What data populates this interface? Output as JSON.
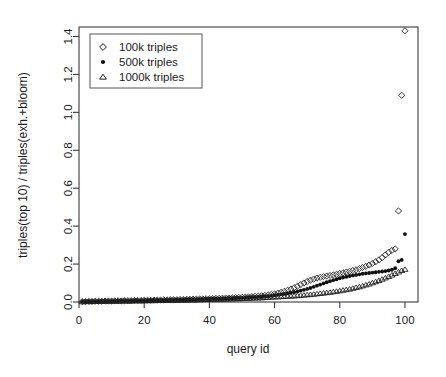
{
  "chart_data": {
    "type": "scatter",
    "title": "",
    "xlabel": "query id",
    "ylabel": "triples(top 10) / triples(exh.+bloom)",
    "xlim": [
      0,
      104
    ],
    "ylim": [
      0.0,
      1.45
    ],
    "xticks": [
      0,
      20,
      40,
      60,
      80,
      100
    ],
    "xtick_labels": [
      "0",
      "20",
      "40",
      "60",
      "80",
      "100"
    ],
    "yticks": [
      0.0,
      0.2,
      0.4,
      0.6,
      0.8,
      1.0,
      1.2,
      1.4
    ],
    "ytick_labels": [
      "0.0",
      "0.2",
      "0.4",
      "0.6",
      "0.8",
      "1.0",
      "1.2",
      "1.4"
    ],
    "grid": false,
    "legend_position": "top-left",
    "series": [
      {
        "name": "100k triples",
        "marker": "open-diamond",
        "color": "#202020",
        "x": [
          1,
          2,
          3,
          4,
          5,
          6,
          7,
          8,
          9,
          10,
          11,
          12,
          13,
          14,
          15,
          16,
          17,
          18,
          19,
          20,
          21,
          22,
          23,
          24,
          25,
          26,
          27,
          28,
          29,
          30,
          31,
          32,
          33,
          34,
          35,
          36,
          37,
          38,
          39,
          40,
          41,
          42,
          43,
          44,
          45,
          46,
          47,
          48,
          49,
          50,
          51,
          52,
          53,
          54,
          55,
          56,
          57,
          58,
          59,
          60,
          61,
          62,
          63,
          64,
          65,
          66,
          67,
          68,
          69,
          70,
          71,
          72,
          73,
          74,
          75,
          76,
          77,
          78,
          79,
          80,
          81,
          82,
          83,
          84,
          85,
          86,
          87,
          88,
          89,
          90,
          91,
          92,
          93,
          94,
          95,
          96,
          97,
          98,
          99,
          100
        ],
        "y": [
          0.002,
          0.002,
          0.003,
          0.003,
          0.004,
          0.004,
          0.004,
          0.005,
          0.005,
          0.005,
          0.006,
          0.006,
          0.006,
          0.007,
          0.007,
          0.007,
          0.008,
          0.008,
          0.008,
          0.009,
          0.009,
          0.009,
          0.01,
          0.01,
          0.01,
          0.011,
          0.011,
          0.012,
          0.012,
          0.012,
          0.013,
          0.013,
          0.014,
          0.014,
          0.015,
          0.015,
          0.016,
          0.016,
          0.017,
          0.017,
          0.018,
          0.019,
          0.019,
          0.02,
          0.021,
          0.021,
          0.022,
          0.023,
          0.024,
          0.025,
          0.026,
          0.027,
          0.028,
          0.03,
          0.031,
          0.033,
          0.035,
          0.037,
          0.04,
          0.043,
          0.047,
          0.051,
          0.056,
          0.062,
          0.068,
          0.075,
          0.083,
          0.092,
          0.1,
          0.108,
          0.115,
          0.121,
          0.126,
          0.13,
          0.134,
          0.137,
          0.14,
          0.143,
          0.146,
          0.15,
          0.154,
          0.158,
          0.162,
          0.166,
          0.17,
          0.176,
          0.182,
          0.188,
          0.195,
          0.203,
          0.212,
          0.222,
          0.234,
          0.248,
          0.262,
          0.272,
          0.28,
          0.48,
          1.09,
          1.43
        ]
      },
      {
        "name": "500k triples",
        "marker": "filled-circle",
        "color": "#101010",
        "x": [
          1,
          2,
          3,
          4,
          5,
          6,
          7,
          8,
          9,
          10,
          11,
          12,
          13,
          14,
          15,
          16,
          17,
          18,
          19,
          20,
          21,
          22,
          23,
          24,
          25,
          26,
          27,
          28,
          29,
          30,
          31,
          32,
          33,
          34,
          35,
          36,
          37,
          38,
          39,
          40,
          41,
          42,
          43,
          44,
          45,
          46,
          47,
          48,
          49,
          50,
          51,
          52,
          53,
          54,
          55,
          56,
          57,
          58,
          59,
          60,
          61,
          62,
          63,
          64,
          65,
          66,
          67,
          68,
          69,
          70,
          71,
          72,
          73,
          74,
          75,
          76,
          77,
          78,
          79,
          80,
          81,
          82,
          83,
          84,
          85,
          86,
          87,
          88,
          89,
          90,
          91,
          92,
          93,
          94,
          95,
          96,
          97,
          98,
          99,
          100
        ],
        "y": [
          0.002,
          0.002,
          0.003,
          0.003,
          0.003,
          0.004,
          0.004,
          0.004,
          0.005,
          0.005,
          0.005,
          0.006,
          0.006,
          0.006,
          0.006,
          0.007,
          0.007,
          0.007,
          0.008,
          0.008,
          0.008,
          0.009,
          0.009,
          0.009,
          0.01,
          0.01,
          0.01,
          0.011,
          0.011,
          0.012,
          0.012,
          0.012,
          0.013,
          0.013,
          0.014,
          0.014,
          0.015,
          0.015,
          0.016,
          0.016,
          0.017,
          0.017,
          0.018,
          0.018,
          0.019,
          0.02,
          0.02,
          0.021,
          0.022,
          0.023,
          0.024,
          0.025,
          0.026,
          0.027,
          0.028,
          0.029,
          0.031,
          0.032,
          0.034,
          0.036,
          0.038,
          0.04,
          0.043,
          0.046,
          0.049,
          0.052,
          0.056,
          0.06,
          0.064,
          0.069,
          0.074,
          0.08,
          0.086,
          0.092,
          0.098,
          0.104,
          0.11,
          0.115,
          0.12,
          0.125,
          0.129,
          0.133,
          0.137,
          0.14,
          0.143,
          0.146,
          0.149,
          0.151,
          0.153,
          0.155,
          0.157,
          0.159,
          0.161,
          0.163,
          0.166,
          0.17,
          0.178,
          0.215,
          0.222,
          0.358
        ]
      },
      {
        "name": "1000k triples",
        "marker": "open-triangle",
        "color": "#202020",
        "x": [
          1,
          2,
          3,
          4,
          5,
          6,
          7,
          8,
          9,
          10,
          11,
          12,
          13,
          14,
          15,
          16,
          17,
          18,
          19,
          20,
          21,
          22,
          23,
          24,
          25,
          26,
          27,
          28,
          29,
          30,
          31,
          32,
          33,
          34,
          35,
          36,
          37,
          38,
          39,
          40,
          41,
          42,
          43,
          44,
          45,
          46,
          47,
          48,
          49,
          50,
          51,
          52,
          53,
          54,
          55,
          56,
          57,
          58,
          59,
          60,
          61,
          62,
          63,
          64,
          65,
          66,
          67,
          68,
          69,
          70,
          71,
          72,
          73,
          74,
          75,
          76,
          77,
          78,
          79,
          80,
          81,
          82,
          83,
          84,
          85,
          86,
          87,
          88,
          89,
          90,
          91,
          92,
          93,
          94,
          95,
          96,
          97,
          98,
          99,
          100
        ],
        "y": [
          0.001,
          0.002,
          0.002,
          0.002,
          0.003,
          0.003,
          0.003,
          0.003,
          0.004,
          0.004,
          0.004,
          0.004,
          0.005,
          0.005,
          0.005,
          0.005,
          0.006,
          0.006,
          0.006,
          0.006,
          0.007,
          0.007,
          0.007,
          0.008,
          0.008,
          0.008,
          0.008,
          0.009,
          0.009,
          0.009,
          0.01,
          0.01,
          0.01,
          0.011,
          0.011,
          0.011,
          0.012,
          0.012,
          0.013,
          0.013,
          0.013,
          0.014,
          0.014,
          0.015,
          0.015,
          0.016,
          0.016,
          0.017,
          0.017,
          0.018,
          0.019,
          0.019,
          0.02,
          0.021,
          0.021,
          0.022,
          0.023,
          0.024,
          0.025,
          0.026,
          0.027,
          0.028,
          0.029,
          0.03,
          0.031,
          0.032,
          0.033,
          0.035,
          0.036,
          0.038,
          0.039,
          0.041,
          0.043,
          0.045,
          0.047,
          0.049,
          0.051,
          0.054,
          0.056,
          0.059,
          0.062,
          0.065,
          0.068,
          0.072,
          0.076,
          0.08,
          0.085,
          0.09,
          0.095,
          0.101,
          0.107,
          0.113,
          0.12,
          0.127,
          0.134,
          0.142,
          0.15,
          0.158,
          0.166,
          0.172
        ]
      }
    ]
  }
}
